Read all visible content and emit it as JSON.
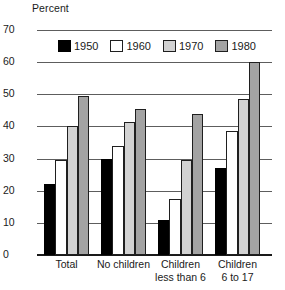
{
  "axis_title": "Percent",
  "legend": [
    {
      "label": "1950",
      "color": "#000000"
    },
    {
      "label": "1960",
      "color": "#ffffff"
    },
    {
      "label": "1970",
      "color": "#d2d2d2"
    },
    {
      "label": "1980",
      "color": "#a3a3a3"
    }
  ],
  "yticks": [
    "0",
    "10",
    "20",
    "30",
    "40",
    "50",
    "60",
    "70"
  ],
  "xlabels": [
    {
      "line1": "Total",
      "line2": ""
    },
    {
      "line1": "No children",
      "line2": ""
    },
    {
      "line1": "Children",
      "line2": "less than 6"
    },
    {
      "line1": "Children",
      "line2": "6 to 17"
    }
  ],
  "chart_data": {
    "type": "bar",
    "title": "",
    "xlabel": "",
    "ylabel": "Percent",
    "ylim": [
      0,
      70
    ],
    "ytick_step": 10,
    "grid": true,
    "legend_position": "top-inside",
    "categories": [
      "Total",
      "No children",
      "Children less than 6",
      "Children 6 to 17"
    ],
    "series": [
      {
        "name": "1950",
        "color": "#000000",
        "values": [
          22,
          30,
          11,
          27
        ]
      },
      {
        "name": "1960",
        "color": "#ffffff",
        "values": [
          29.5,
          34,
          17.5,
          38.5
        ]
      },
      {
        "name": "1970",
        "color": "#d2d2d2",
        "values": [
          40,
          41.5,
          29.5,
          48.5
        ]
      },
      {
        "name": "1980",
        "color": "#a3a3a3",
        "values": [
          49.5,
          45.5,
          44,
          60
        ]
      }
    ]
  }
}
